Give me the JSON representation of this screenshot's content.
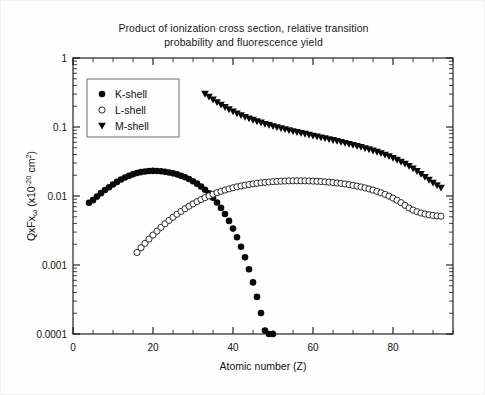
{
  "chart_data": {
    "type": "scatter",
    "title": "Product of ionization cross section, relative transition probability and fluorescence yield",
    "title_line1": "Product of ionization cross section, relative transition",
    "title_line2": "probability and fluorescence yield",
    "xlabel": "Atomic number (Z)",
    "ylabel": "QxFxw (x10-20 cm2)",
    "ylabel_main": "QxFx",
    "ylabel_sub": "ω",
    "ylabel_unit_pre": " (x10",
    "ylabel_unit_exp": "-20",
    "ylabel_unit_post": " cm",
    "ylabel_unit_exp2": "2",
    "ylabel_unit_close": ")",
    "xlim": [
      0,
      95
    ],
    "ylim": [
      0.0001,
      1
    ],
    "yscale": "log",
    "xscale": "linear",
    "grid": false,
    "legend_position": "upper-left",
    "xticks": [
      0,
      20,
      40,
      60,
      80
    ],
    "xtick_labels": [
      "0",
      "20",
      "40",
      "60",
      "80"
    ],
    "xminor_step": 5,
    "yticks": [
      1,
      0.1,
      0.01,
      0.001,
      0.0001
    ],
    "ytick_labels": [
      "1",
      "0.1",
      "0.01",
      "0.001",
      "0.0001"
    ],
    "series": [
      {
        "name": "K-shell",
        "marker": "filled-circle",
        "color": "#0a0a0a",
        "points": [
          [
            4,
            0.008
          ],
          [
            5,
            0.0087
          ],
          [
            6,
            0.0098
          ],
          [
            7,
            0.011
          ],
          [
            8,
            0.0122
          ],
          [
            9,
            0.0134
          ],
          [
            10,
            0.0147
          ],
          [
            11,
            0.016
          ],
          [
            12,
            0.0173
          ],
          [
            13,
            0.0185
          ],
          [
            14,
            0.0196
          ],
          [
            15,
            0.0206
          ],
          [
            16,
            0.0215
          ],
          [
            17,
            0.0222
          ],
          [
            18,
            0.0227
          ],
          [
            19,
            0.023
          ],
          [
            20,
            0.0231
          ],
          [
            21,
            0.023
          ],
          [
            22,
            0.0228
          ],
          [
            23,
            0.0224
          ],
          [
            24,
            0.0219
          ],
          [
            25,
            0.0213
          ],
          [
            26,
            0.0206
          ],
          [
            27,
            0.0197
          ],
          [
            28,
            0.0187
          ],
          [
            29,
            0.0176
          ],
          [
            30,
            0.0164
          ],
          [
            31,
            0.0151
          ],
          [
            32,
            0.0137
          ],
          [
            33,
            0.0123
          ],
          [
            34,
            0.0109
          ],
          [
            35,
            0.00945
          ],
          [
            36,
            0.00805
          ],
          [
            37,
            0.00672
          ],
          [
            38,
            0.00548
          ],
          [
            39,
            0.00436
          ],
          [
            40,
            0.00337
          ],
          [
            41,
            0.00253
          ],
          [
            42,
            0.00184
          ],
          [
            43,
            0.00129
          ],
          [
            44,
            0.000868
          ],
          [
            45,
            0.00056
          ],
          [
            46,
            0.000345
          ],
          [
            47,
            0.000202
          ],
          [
            48,
            0.000112
          ],
          [
            49,
            5.9e-05
          ],
          [
            50,
            0.0001
          ]
        ]
      },
      {
        "name": "L-shell",
        "marker": "open-circle",
        "color": "#ffffff",
        "points": [
          [
            16,
            0.00152
          ],
          [
            17,
            0.00178
          ],
          [
            18,
            0.00206
          ],
          [
            19,
            0.00238
          ],
          [
            20,
            0.00272
          ],
          [
            21,
            0.0031
          ],
          [
            22,
            0.00352
          ],
          [
            23,
            0.00396
          ],
          [
            24,
            0.00443
          ],
          [
            25,
            0.00492
          ],
          [
            26,
            0.00544
          ],
          [
            27,
            0.00598
          ],
          [
            28,
            0.00654
          ],
          [
            29,
            0.00711
          ],
          [
            30,
            0.00769
          ],
          [
            31,
            0.00828
          ],
          [
            32,
            0.00887
          ],
          [
            33,
            0.00946
          ],
          [
            34,
            0.01004
          ],
          [
            35,
            0.01061
          ],
          [
            36,
            0.01117
          ],
          [
            37,
            0.0117
          ],
          [
            38,
            0.01221
          ],
          [
            39,
            0.0127
          ],
          [
            40,
            0.01316
          ],
          [
            41,
            0.01359
          ],
          [
            42,
            0.01399
          ],
          [
            43,
            0.01436
          ],
          [
            44,
            0.0147
          ],
          [
            45,
            0.01501
          ],
          [
            46,
            0.01529
          ],
          [
            47,
            0.01554
          ],
          [
            48,
            0.01576
          ],
          [
            49,
            0.01596
          ],
          [
            50,
            0.01613
          ],
          [
            51,
            0.01627
          ],
          [
            52,
            0.01639
          ],
          [
            53,
            0.01648
          ],
          [
            54,
            0.01655
          ],
          [
            55,
            0.01659
          ],
          [
            56,
            0.01661
          ],
          [
            57,
            0.0166
          ],
          [
            58,
            0.01657
          ],
          [
            59,
            0.01652
          ],
          [
            60,
            0.01644
          ],
          [
            61,
            0.01634
          ],
          [
            62,
            0.01621
          ],
          [
            63,
            0.01606
          ],
          [
            64,
            0.01588
          ],
          [
            65,
            0.01568
          ],
          [
            66,
            0.01545
          ],
          [
            67,
            0.0152
          ],
          [
            68,
            0.01492
          ],
          [
            69,
            0.01461
          ],
          [
            70,
            0.01428
          ],
          [
            71,
            0.01392
          ],
          [
            72,
            0.01353
          ],
          [
            73,
            0.01311
          ],
          [
            74,
            0.01266
          ],
          [
            75,
            0.01218
          ],
          [
            76,
            0.01167
          ],
          [
            77,
            0.01113
          ],
          [
            78,
            0.01056
          ],
          [
            79,
            0.00996
          ],
          [
            80,
            0.00933
          ],
          [
            81,
            0.00868
          ],
          [
            82,
            0.00801
          ],
          [
            83,
            0.00733
          ],
          [
            84,
            0.0067
          ],
          [
            85,
            0.00625
          ],
          [
            86,
            0.00592
          ],
          [
            87,
            0.00567
          ],
          [
            88,
            0.00548
          ],
          [
            89,
            0.00534
          ],
          [
            90,
            0.00523
          ],
          [
            91,
            0.00515
          ],
          [
            92,
            0.00509
          ]
        ]
      },
      {
        "name": "M-shell",
        "marker": "filled-triangle-down",
        "color": "#0a0a0a",
        "points": [
          [
            33,
            0.3
          ],
          [
            34,
            0.272
          ],
          [
            35,
            0.248
          ],
          [
            36,
            0.227
          ],
          [
            37,
            0.209
          ],
          [
            38,
            0.193
          ],
          [
            39,
            0.179
          ],
          [
            40,
            0.167
          ],
          [
            41,
            0.156
          ],
          [
            42,
            0.147
          ],
          [
            43,
            0.139
          ],
          [
            44,
            0.132
          ],
          [
            45,
            0.126
          ],
          [
            46,
            0.12
          ],
          [
            47,
            0.115
          ],
          [
            48,
            0.11
          ],
          [
            49,
            0.106
          ],
          [
            50,
            0.102
          ],
          [
            51,
            0.0985
          ],
          [
            52,
            0.0952
          ],
          [
            53,
            0.0921
          ],
          [
            54,
            0.0892
          ],
          [
            55,
            0.0864
          ],
          [
            56,
            0.0838
          ],
          [
            57,
            0.0813
          ],
          [
            58,
            0.0789
          ],
          [
            59,
            0.0766
          ],
          [
            60,
            0.0744
          ],
          [
            61,
            0.0722
          ],
          [
            62,
            0.0701
          ],
          [
            63,
            0.0681
          ],
          [
            64,
            0.0661
          ],
          [
            65,
            0.0641
          ],
          [
            66,
            0.0622
          ],
          [
            67,
            0.0603
          ],
          [
            68,
            0.0584
          ],
          [
            69,
            0.0565
          ],
          [
            70,
            0.0546
          ],
          [
            71,
            0.0528
          ],
          [
            72,
            0.0509
          ],
          [
            73,
            0.049
          ],
          [
            74,
            0.0471
          ],
          [
            75,
            0.0452
          ],
          [
            76,
            0.0433
          ],
          [
            77,
            0.0414
          ],
          [
            78,
            0.0394
          ],
          [
            79,
            0.0374
          ],
          [
            80,
            0.0354
          ],
          [
            81,
            0.0333
          ],
          [
            82,
            0.0312
          ],
          [
            83,
            0.0291
          ],
          [
            84,
            0.027
          ],
          [
            85,
            0.0249
          ],
          [
            86,
            0.0228
          ],
          [
            87,
            0.0207
          ],
          [
            88,
            0.0187
          ],
          [
            89,
            0.017
          ],
          [
            90,
            0.0155
          ],
          [
            91,
            0.0142
          ],
          [
            92,
            0.0131
          ]
        ]
      }
    ],
    "legend": [
      {
        "label": "K-shell",
        "marker": "filled-circle"
      },
      {
        "label": "L-shell",
        "marker": "open-circle"
      },
      {
        "label": "M-shell",
        "marker": "filled-triangle-down"
      }
    ]
  }
}
